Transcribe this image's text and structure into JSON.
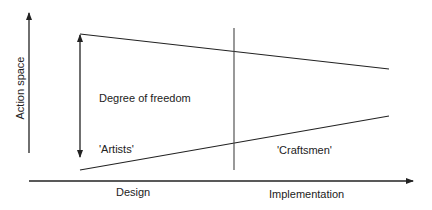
{
  "diagram": {
    "axes": {
      "y_label": "Action space",
      "x_label_left": "Design",
      "x_label_right": "Implementation"
    },
    "annotations": {
      "degree_of_freedom": "Degree of freedom",
      "artists": "'Artists'",
      "craftsmen": "'Craftsmen'"
    },
    "colors": {
      "line": "#222222",
      "background": "#ffffff"
    }
  }
}
